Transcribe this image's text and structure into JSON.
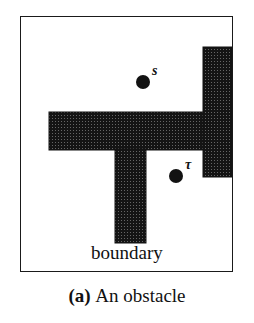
{
  "figure": {
    "caption_index": "(a)",
    "caption_text": "An obstacle",
    "boundary_label": "boundary",
    "box": {
      "x": 20,
      "y": 16,
      "width": 213,
      "height": 256
    },
    "colors": {
      "ink": "#111111",
      "obstacle_fill": "#151515",
      "obstacle_hatch": "#6f6f6f",
      "background": "#ffffff",
      "border": "#1a1a1a"
    },
    "points": [
      {
        "id": "s",
        "label": "s",
        "cx": 143,
        "cy": 82,
        "r": 7,
        "label_x": 152,
        "label_y": 64
      },
      {
        "id": "tau",
        "label": "τ",
        "cx": 176,
        "cy": 176,
        "r": 7,
        "label_x": 185,
        "label_y": 158
      }
    ],
    "obstacle": {
      "description": "T-shaped hatched polygon joined to a vertical bar at the right edge",
      "parts": [
        {
          "name": "horizontal-arm",
          "x": 49,
          "y": 112,
          "width": 184,
          "height": 38
        },
        {
          "name": "vertical-stem",
          "x": 115,
          "y": 150,
          "width": 31,
          "height": 93
        },
        {
          "name": "right-column",
          "x": 203,
          "y": 47,
          "width": 30,
          "height": 130
        }
      ]
    }
  }
}
